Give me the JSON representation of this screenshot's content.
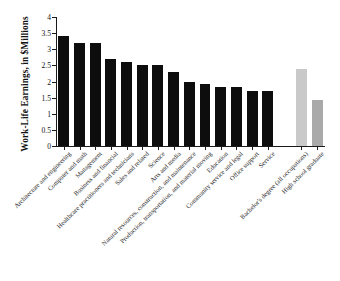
{
  "chart_data": {
    "type": "bar",
    "title": "",
    "xlabel": "",
    "ylabel": "Work-Life Earnings, in $Millions",
    "ylim": [
      0,
      4
    ],
    "ytick_labels": [
      "0",
      "0.5",
      "1",
      "1.5",
      "2",
      "2.5",
      "3",
      "3.5",
      "4"
    ],
    "ytick_values": [
      0,
      0.5,
      1,
      1.5,
      2,
      2.5,
      3,
      3.5,
      4
    ],
    "grid": false,
    "legend": "none",
    "categories": [
      "Architecture and engineering",
      "Computer and math",
      "Management",
      "Business and financial",
      "Healthcare practitioners and technicians",
      "Sales and related",
      "Science",
      "Arts and media",
      "Natural resources, construction, and maintenance",
      "Production, transportation, and material moving",
      "Education",
      "Community service and legal",
      "Office support",
      "Service",
      "Bachelor's degree (all occupations)",
      "High school graduate"
    ],
    "values": [
      3.4,
      3.2,
      3.2,
      2.7,
      2.6,
      2.5,
      2.5,
      2.3,
      2.0,
      1.92,
      1.83,
      1.83,
      1.72,
      1.72,
      2.4,
      1.43
    ],
    "bar_colors": [
      "#0d0d0d",
      "#0d0d0d",
      "#0d0d0d",
      "#0d0d0d",
      "#0d0d0d",
      "#0d0d0d",
      "#0d0d0d",
      "#0d0d0d",
      "#0d0d0d",
      "#0d0d0d",
      "#0d0d0d",
      "#0d0d0d",
      "#0d0d0d",
      "#0d0d0d",
      "#c9c9c9",
      "#a9a9a9"
    ],
    "gap_after_index": 13,
    "colors": {
      "occupation_bar": "#0d0d0d",
      "bachelors_bar": "#c9c9c9",
      "highschool_bar": "#a9a9a9",
      "axis": "#1a1a1a",
      "background": "#ffffff"
    }
  }
}
